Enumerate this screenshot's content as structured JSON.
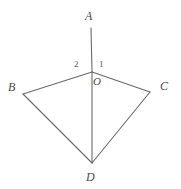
{
  "figure": {
    "name": "quadrilateral-with-angles-at-o",
    "background_color": "#ffffff",
    "stroke_color": "#6a6a6a",
    "label_color": "#4a4a4a",
    "stroke_width": 1,
    "width": 181,
    "height": 189
  },
  "points": {
    "A": {
      "label": "A",
      "x": 91,
      "y": 28,
      "label_x": 85,
      "label_y": 10
    },
    "B": {
      "label": "B",
      "x": 23,
      "y": 94,
      "label_x": 8,
      "label_y": 81
    },
    "C": {
      "label": "C",
      "x": 150,
      "y": 92,
      "label_x": 160,
      "label_y": 80
    },
    "D": {
      "label": "D",
      "x": 92,
      "y": 163,
      "label_x": 86,
      "label_y": 171
    },
    "O": {
      "label": "O",
      "x": 92,
      "y": 72,
      "label_x": 93,
      "label_y": 76
    }
  },
  "angles": {
    "angle_1": {
      "label": "1",
      "label_x": 99,
      "label_y": 60
    },
    "angle_2": {
      "label": "2",
      "label_x": 74,
      "label_y": 60
    }
  },
  "segments": [
    {
      "name": "segment-a-o",
      "from": "A",
      "to": "O"
    },
    {
      "name": "segment-o-d",
      "from": "O",
      "to": "D"
    },
    {
      "name": "segment-o-b",
      "from": "O",
      "to": "B"
    },
    {
      "name": "segment-o-c",
      "from": "O",
      "to": "C"
    },
    {
      "name": "segment-b-d",
      "from": "B",
      "to": "D"
    },
    {
      "name": "segment-c-d",
      "from": "C",
      "to": "D"
    }
  ]
}
